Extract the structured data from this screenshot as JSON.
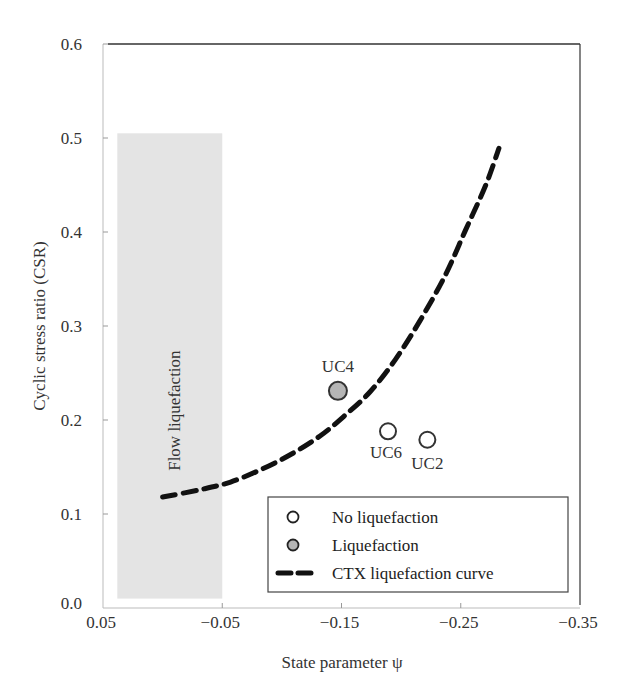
{
  "chart_data": {
    "type": "scatter",
    "title": "",
    "xlabel": "State parameter ψ",
    "ylabel": "Cyclic stress ratio (CSR)",
    "xlim": [
      0.05,
      -0.35
    ],
    "ylim": [
      0.0,
      0.6
    ],
    "x_ticks": [
      "0.05",
      "−0.05",
      "−0.15",
      "−0.25",
      "−0.35"
    ],
    "x_tick_values": [
      0.05,
      -0.05,
      -0.15,
      -0.25,
      -0.35
    ],
    "y_ticks": [
      "0.0",
      "0.1",
      "0.2",
      "0.3",
      "0.4",
      "0.5",
      "0.6"
    ],
    "y_tick_values": [
      0.0,
      0.1,
      0.2,
      0.3,
      0.4,
      0.5,
      0.6
    ],
    "grid": false,
    "shaded_region": {
      "label": "Flow liquefaction",
      "x_range": [
        0.038,
        -0.05
      ],
      "y_range": [
        0.01,
        0.505
      ],
      "color": "#e4e4e4"
    },
    "series": [
      {
        "name": "No liquefaction",
        "marker": "open-circle",
        "points": [
          {
            "label": "UC6",
            "x": -0.189,
            "y": 0.188
          },
          {
            "label": "UC2",
            "x": -0.222,
            "y": 0.179
          }
        ]
      },
      {
        "name": "Liquefaction",
        "marker": "filled-circle",
        "fill": "#b5b5b5",
        "points": [
          {
            "label": "UC4",
            "x": -0.147,
            "y": 0.231
          }
        ]
      },
      {
        "name": "CTX liquefaction curve",
        "style": "dashed",
        "x": [
          0.0,
          -0.032,
          -0.057,
          -0.082,
          -0.107,
          -0.132,
          -0.153,
          -0.174,
          -0.195,
          -0.216,
          -0.237,
          -0.254,
          -0.271,
          -0.282
        ],
        "y": [
          0.118,
          0.126,
          0.134,
          0.147,
          0.163,
          0.183,
          0.205,
          0.23,
          0.264,
          0.306,
          0.354,
          0.402,
          0.45,
          0.489
        ]
      }
    ],
    "legend": {
      "position": "lower-right",
      "entries": [
        "No liquefaction",
        "Liquefaction",
        "CTX liquefaction curve"
      ]
    }
  }
}
